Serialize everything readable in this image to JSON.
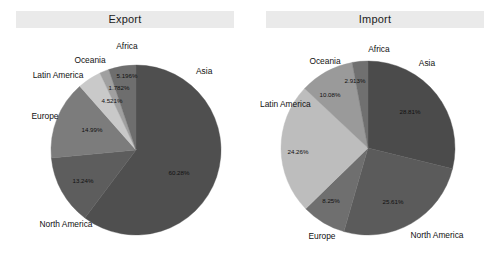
{
  "figure": {
    "background": "#ffffff",
    "width": 499,
    "height": 260
  },
  "panels": [
    {
      "id": "export",
      "title": "Export",
      "banner_color": "#eaeaea"
    },
    {
      "id": "import",
      "title": "Import",
      "banner_color": "#eaeaea"
    }
  ],
  "chart_data": [
    {
      "type": "pie",
      "title": "Export",
      "xlabel": "",
      "ylabel": "",
      "legend": "none",
      "grid": false,
      "start_angle_deg": 0,
      "direction": "clockwise",
      "categories": [
        "Asia",
        "North America",
        "Europe",
        "Latin America",
        "Oceania",
        "Africa"
      ],
      "values": [
        60.28,
        13.24,
        14.99,
        4.521,
        1.782,
        5.196
      ],
      "value_labels": [
        "60.28%",
        "13.24%",
        "14.99%",
        "4.521%",
        "1.782%",
        "5.196%"
      ],
      "slice_colors": [
        "#4f4f4f",
        "#5d5d5d",
        "#7c7c7c",
        "#c9c9c9",
        "#a0a0a0",
        "#6e6e6e"
      ]
    },
    {
      "type": "pie",
      "title": "Import",
      "xlabel": "",
      "ylabel": "",
      "legend": "none",
      "grid": false,
      "start_angle_deg": 0,
      "direction": "clockwise",
      "categories": [
        "Asia",
        "North America",
        "Europe",
        "Latin America",
        "Oceania",
        "Africa"
      ],
      "values": [
        28.81,
        25.61,
        8.25,
        24.26,
        10.08,
        2.913
      ],
      "value_labels": [
        "28.81%",
        "25.61%",
        "8.25%",
        "24.26%",
        "10.08%",
        "2.913%"
      ],
      "slice_colors": [
        "#4b4b4b",
        "#5b5b5b",
        "#6f6f6f",
        "#bdbdbd",
        "#9a9a9a",
        "#707070"
      ]
    }
  ],
  "export_chart": {
    "center_x": 136,
    "center_y": 150,
    "radius": 85,
    "pct_labels": [
      {
        "name": "asia",
        "text": "60.28%",
        "x": 179,
        "y": 173
      },
      {
        "name": "north-america",
        "text": "13.24%",
        "x": 83,
        "y": 181
      },
      {
        "name": "europe",
        "text": "14.99%",
        "x": 92,
        "y": 130
      },
      {
        "name": "latin-america",
        "text": "4.521%",
        "x": 112,
        "y": 101
      },
      {
        "name": "oceania",
        "text": "1.782%",
        "x": 119,
        "y": 88
      },
      {
        "name": "africa",
        "text": "5.196%",
        "x": 127,
        "y": 76
      }
    ],
    "cat_labels": [
      {
        "name": "asia",
        "text": "Asia",
        "x": 196,
        "y": 72,
        "anchor": "start"
      },
      {
        "name": "north-america",
        "text": "North America",
        "x": 66,
        "y": 225,
        "anchor": "middle"
      },
      {
        "name": "europe",
        "text": "Europe",
        "x": 45,
        "y": 117,
        "anchor": "middle"
      },
      {
        "name": "latin-america",
        "text": "Latin America",
        "x": 58,
        "y": 76,
        "anchor": "middle"
      },
      {
        "name": "oceania",
        "text": "Oceania",
        "x": 90,
        "y": 61,
        "anchor": "middle"
      },
      {
        "name": "africa",
        "text": "Africa",
        "x": 127,
        "y": 47,
        "anchor": "middle"
      }
    ]
  },
  "import_chart": {
    "center_x": 118,
    "center_y": 148,
    "radius": 87,
    "pct_labels": [
      {
        "name": "asia",
        "text": "28.81%",
        "x": 160,
        "y": 112
      },
      {
        "name": "north-america",
        "text": "25.61%",
        "x": 143,
        "y": 202
      },
      {
        "name": "europe",
        "text": "8.25%",
        "x": 81,
        "y": 201
      },
      {
        "name": "latin-america",
        "text": "24.26%",
        "x": 48,
        "y": 152
      },
      {
        "name": "oceania",
        "text": "10.08%",
        "x": 80,
        "y": 95
      },
      {
        "name": "africa",
        "text": "2.913%",
        "x": 105,
        "y": 81
      }
    ],
    "cat_labels": [
      {
        "name": "asia",
        "text": "Asia",
        "x": 177,
        "y": 64,
        "anchor": "middle"
      },
      {
        "name": "north-america",
        "text": "North America",
        "x": 187,
        "y": 236,
        "anchor": "middle"
      },
      {
        "name": "europe",
        "text": "Europe",
        "x": 72,
        "y": 237,
        "anchor": "middle"
      },
      {
        "name": "latin-america",
        "text": "Latin America",
        "x": 10,
        "y": 105,
        "anchor": "start"
      },
      {
        "name": "oceania",
        "text": "Oceania",
        "x": 75,
        "y": 62,
        "anchor": "middle"
      },
      {
        "name": "africa",
        "text": "Africa",
        "x": 129,
        "y": 50,
        "anchor": "middle"
      }
    ]
  }
}
